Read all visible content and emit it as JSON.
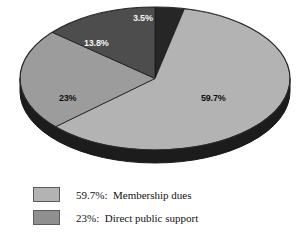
{
  "chart_data": {
    "type": "pie",
    "title": "",
    "subtitle": "",
    "xlabel": "",
    "ylabel": "",
    "grid": false,
    "legend_position": "bottom-left",
    "three_d": true,
    "categories": [
      "Membership dues",
      "Direct public support",
      "Slice 13.8%",
      "Slice 3.5%"
    ],
    "values": [
      59.7,
      23,
      13.8,
      3.5
    ],
    "slices": [
      {
        "label": "59.7%",
        "value": 59.7,
        "color": "#b3b3b3",
        "name": "Membership dues"
      },
      {
        "label": "23%",
        "value": 23,
        "color": "#9c9c9c",
        "name": "Direct public support"
      },
      {
        "label": "13.8%",
        "value": 13.8,
        "color": "#4d4d4d",
        "name": ""
      },
      {
        "label": "3.5%",
        "value": 3.5,
        "color": "#262626",
        "name": ""
      }
    ]
  },
  "pie": {
    "labels": {
      "membership": "59.7%",
      "direct_public_support": "23%",
      "third_slice": "13.8%",
      "fourth_slice": "3.5%"
    }
  },
  "legend": {
    "items": [
      {
        "text": "59.7%:  Membership dues",
        "color": "#b3b3b3"
      },
      {
        "text": "23%:  Direct public support",
        "color": "#8f8f8f"
      }
    ]
  },
  "colors": {
    "slice_membership": "#b3b3b3",
    "slice_direct_public": "#9c9c9c",
    "slice_third": "#4d4d4d",
    "slice_fourth": "#262626",
    "rim_dark": "#1c1c1c",
    "outline": "#2a2a2a",
    "background": "#ffffff",
    "text": "#111111"
  }
}
